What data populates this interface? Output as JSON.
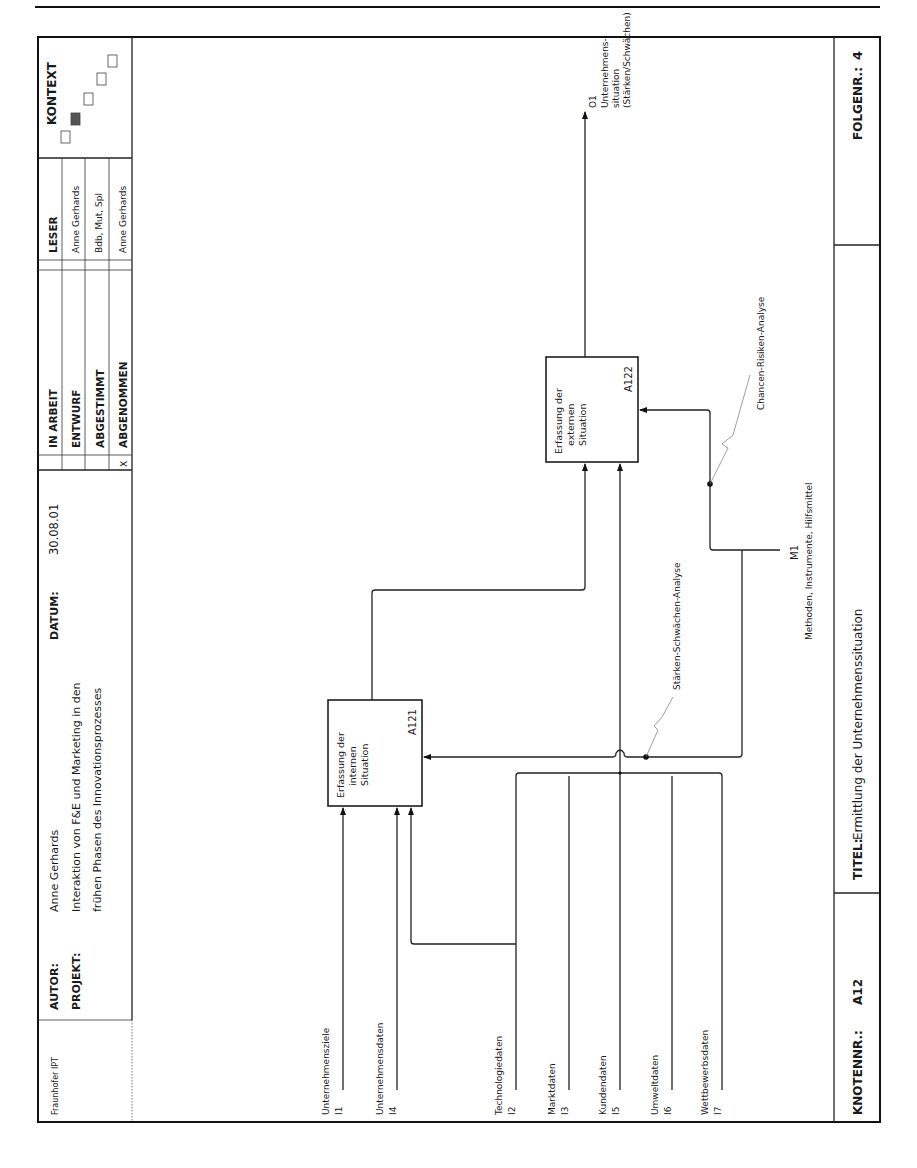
{
  "header": {
    "organization": "Fraunhofer IPT",
    "author_label": "AUTOR:",
    "author": "Anne Gerhards",
    "project_label": "PROJEKT:",
    "project_line1": "Interaktion von F&E und Marketing in den",
    "project_line2": "frühen Phasen des Innovationsprozesses",
    "date_label": "DATUM:",
    "date": "30.08.01",
    "status": [
      {
        "mark": "",
        "label": "IN ARBEIT"
      },
      {
        "mark": "",
        "label": "ENTWURF"
      },
      {
        "mark": "",
        "label": "ABGESTIMMT"
      },
      {
        "mark": "X",
        "label": "ABGENOMMEN"
      }
    ],
    "reader_label": "LESER",
    "readers": [
      "Anne Gerhards",
      "Bdb, Mut, Spl",
      "Anne Gerhards"
    ],
    "context_label": "KONTEXT"
  },
  "diagram": {
    "activities": [
      {
        "id": "A121",
        "line1": "Erfassung der",
        "line2": "internen",
        "line3": "Situation"
      },
      {
        "id": "A122",
        "line1": "Erfassung der",
        "line2": "externen",
        "line3": "Situation"
      }
    ],
    "inputs": [
      {
        "code": "I1",
        "label": "Unternehmensziele"
      },
      {
        "code": "I4",
        "label": "Unternehmensdaten"
      },
      {
        "code": "I2",
        "label": "Technologiedaten"
      },
      {
        "code": "I3",
        "label": "Marktdaten"
      },
      {
        "code": "I5",
        "label": "Kundendaten"
      },
      {
        "code": "I6",
        "label": "Umweltdaten"
      },
      {
        "code": "I7",
        "label": "Wettbewerbsdaten"
      }
    ],
    "output": {
      "code": "O1",
      "line1": "Unternehmens-",
      "line2": "situation",
      "line3": "(Stärken/Schwächen)"
    },
    "mechanism": {
      "code": "M1",
      "label": "Methoden, Instrumente, Hilfsmittel"
    },
    "annotations": {
      "a121_control": "Stärken-Schwächen-Analyse",
      "a122_control": "Chancen-Risiken-Analyse"
    }
  },
  "footer": {
    "node_label": "KNOTENNR.:",
    "node": "A12",
    "title_label": "TITEL:",
    "title": "Ermittlung der Unternehmenssituation",
    "sequence_label": "FOLGENR.:",
    "sequence": "4"
  }
}
